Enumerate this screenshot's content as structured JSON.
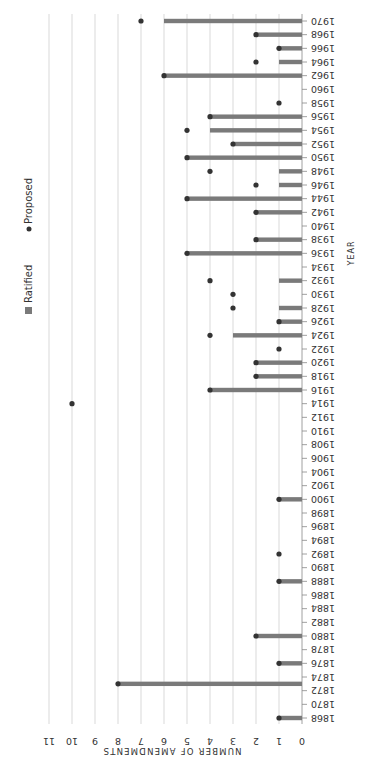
{
  "chart_data": {
    "type": "bar",
    "title": "",
    "orientation_note": "rotated 90 degrees; years run vertically, counts horizontally",
    "xlabel": "YEAR",
    "ylabel": "NUMBER OF AMENDMENTS",
    "ylim": [
      0,
      11
    ],
    "yticks": [
      0,
      1,
      2,
      3,
      4,
      5,
      6,
      7,
      8,
      9,
      10,
      11
    ],
    "xticks": [
      1868,
      1870,
      1872,
      1874,
      1876,
      1878,
      1880,
      1882,
      1884,
      1886,
      1888,
      1890,
      1892,
      1894,
      1896,
      1898,
      1900,
      1902,
      1904,
      1906,
      1908,
      1910,
      1912,
      1914,
      1916,
      1918,
      1920,
      1922,
      1924,
      1926,
      1928,
      1930,
      1932,
      1934,
      1936,
      1938,
      1940,
      1942,
      1944,
      1946,
      1948,
      1950,
      1952,
      1954,
      1956,
      1958,
      1960,
      1962,
      1964,
      1966,
      1968,
      1970
    ],
    "grid": true,
    "legend": [
      {
        "name": "Ratified",
        "marker": "square",
        "color": "#7a7a7a"
      },
      {
        "name": "Proposed",
        "marker": "circle",
        "color": "#333333"
      }
    ],
    "legend_position": "top",
    "x": [
      1868,
      1873,
      1876,
      1880,
      1888,
      1892,
      1900,
      1914,
      1916,
      1918,
      1920,
      1922,
      1924,
      1926,
      1928,
      1930,
      1932,
      1936,
      1938,
      1942,
      1944,
      1946,
      1948,
      1950,
      1952,
      1954,
      1956,
      1958,
      1962,
      1964,
      1966,
      1968,
      1970
    ],
    "series": [
      {
        "name": "Ratified",
        "type": "bar",
        "values": [
          1,
          8,
          1,
          2,
          1,
          0,
          1,
          0,
          4,
          2,
          2,
          0,
          3,
          1,
          1,
          0,
          1,
          5,
          2,
          2,
          5,
          1,
          1,
          5,
          3,
          4,
          4,
          0,
          6,
          1,
          1,
          2,
          6
        ]
      },
      {
        "name": "Proposed",
        "type": "dot",
        "values": [
          1,
          8,
          1,
          2,
          1,
          1,
          1,
          10,
          4,
          2,
          2,
          1,
          4,
          1,
          3,
          3,
          4,
          5,
          2,
          2,
          5,
          2,
          4,
          5,
          3,
          5,
          4,
          1,
          6,
          2,
          1,
          2,
          7
        ]
      }
    ]
  },
  "colors": {
    "bar": "#7a7a7a",
    "dot": "#333333",
    "grid": "#cfcfcf",
    "axis": "#888888",
    "text": "#333333"
  },
  "labels": {
    "legend_ratified": "Ratified",
    "legend_proposed": "Proposed",
    "x_axis_title": "YEAR",
    "y_axis_title": "NUMBER OF AMENDMENTS"
  }
}
